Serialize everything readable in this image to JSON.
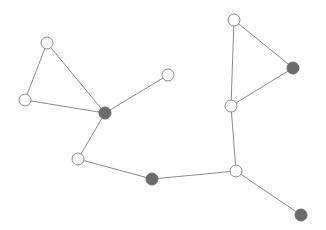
{
  "diagram": {
    "type": "network-graph",
    "width": 326,
    "height": 230,
    "colors": {
      "background": "#ffffff",
      "edge": "#8a8a8a",
      "node_open_fill": "#ffffff",
      "node_open_stroke": "#8a8a8a",
      "node_filled": "#6b6b6b"
    },
    "node_radius": 6,
    "nodes": [
      {
        "id": "A",
        "x": 47,
        "y": 43,
        "filled": false
      },
      {
        "id": "B",
        "x": 25,
        "y": 100,
        "filled": false
      },
      {
        "id": "C",
        "x": 105,
        "y": 113,
        "filled": true
      },
      {
        "id": "D",
        "x": 168,
        "y": 75,
        "filled": false
      },
      {
        "id": "E",
        "x": 78,
        "y": 159,
        "filled": false
      },
      {
        "id": "F",
        "x": 152,
        "y": 179,
        "filled": true
      },
      {
        "id": "G",
        "x": 236,
        "y": 171,
        "filled": false
      },
      {
        "id": "H",
        "x": 301,
        "y": 215,
        "filled": true
      },
      {
        "id": "I",
        "x": 234,
        "y": 20,
        "filled": false
      },
      {
        "id": "J",
        "x": 293,
        "y": 68,
        "filled": true
      },
      {
        "id": "K",
        "x": 231,
        "y": 106,
        "filled": false
      }
    ],
    "edges": [
      [
        "A",
        "B"
      ],
      [
        "A",
        "C"
      ],
      [
        "B",
        "C"
      ],
      [
        "C",
        "D"
      ],
      [
        "C",
        "E"
      ],
      [
        "E",
        "F"
      ],
      [
        "F",
        "G"
      ],
      [
        "G",
        "H"
      ],
      [
        "G",
        "K"
      ],
      [
        "I",
        "J"
      ],
      [
        "I",
        "K"
      ],
      [
        "J",
        "K"
      ]
    ]
  }
}
